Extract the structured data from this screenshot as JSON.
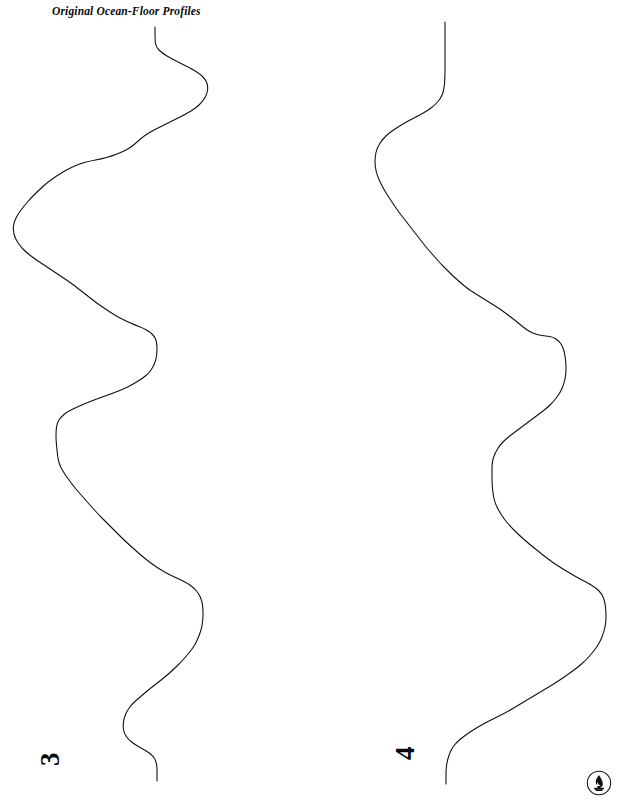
{
  "page": {
    "width": 623,
    "height": 804,
    "background_color": "#ffffff",
    "ink_color": "#111111"
  },
  "figure": {
    "title": "Original Ocean-Floor Profiles",
    "title_style": "bold-italic-serif"
  },
  "profiles": [
    {
      "label": "3",
      "label_orientation": "rotated-90-ccw",
      "name": "ocean-floor-profile-3",
      "description": "Left sounding trace, runs top to bottom with four major lobes",
      "stroke_color": "#111111",
      "stroke_width": 1.1,
      "points": [
        [
          155,
          27
        ],
        [
          155,
          40
        ],
        [
          156,
          47
        ],
        [
          162,
          53
        ],
        [
          172,
          59
        ],
        [
          182,
          64
        ],
        [
          192,
          69
        ],
        [
          200,
          74
        ],
        [
          206,
          80
        ],
        [
          208,
          87
        ],
        [
          207,
          94
        ],
        [
          203,
          101
        ],
        [
          196,
          108
        ],
        [
          186,
          114
        ],
        [
          174,
          120
        ],
        [
          162,
          126
        ],
        [
          152,
          131
        ],
        [
          144,
          136
        ],
        [
          137,
          142
        ],
        [
          130,
          148
        ],
        [
          122,
          152
        ],
        [
          112,
          156
        ],
        [
          101,
          159
        ],
        [
          90,
          161
        ],
        [
          79,
          164
        ],
        [
          68,
          169
        ],
        [
          58,
          175
        ],
        [
          48,
          182
        ],
        [
          39,
          190
        ],
        [
          31,
          198
        ],
        [
          24,
          206
        ],
        [
          18,
          214
        ],
        [
          14,
          222
        ],
        [
          13,
          230
        ],
        [
          15,
          238
        ],
        [
          20,
          246
        ],
        [
          27,
          253
        ],
        [
          35,
          259
        ],
        [
          44,
          265
        ],
        [
          53,
          271
        ],
        [
          62,
          277
        ],
        [
          71,
          283
        ],
        [
          80,
          290
        ],
        [
          89,
          297
        ],
        [
          98,
          304
        ],
        [
          107,
          310
        ],
        [
          116,
          316
        ],
        [
          126,
          321
        ],
        [
          135,
          325
        ],
        [
          143,
          328
        ],
        [
          150,
          332
        ],
        [
          155,
          337
        ],
        [
          157,
          344
        ],
        [
          157,
          352
        ],
        [
          156,
          360
        ],
        [
          153,
          367
        ],
        [
          149,
          373
        ],
        [
          143,
          378
        ],
        [
          135,
          383
        ],
        [
          126,
          388
        ],
        [
          116,
          392
        ],
        [
          105,
          396
        ],
        [
          94,
          400
        ],
        [
          84,
          404
        ],
        [
          75,
          408
        ],
        [
          67,
          412
        ],
        [
          61,
          417
        ],
        [
          57,
          423
        ],
        [
          56,
          431
        ],
        [
          56,
          440
        ],
        [
          57,
          450
        ],
        [
          58,
          459
        ],
        [
          60,
          466
        ],
        [
          64,
          473
        ],
        [
          69,
          480
        ],
        [
          75,
          488
        ],
        [
          82,
          496
        ],
        [
          90,
          505
        ],
        [
          98,
          514
        ],
        [
          107,
          523
        ],
        [
          116,
          532
        ],
        [
          125,
          541
        ],
        [
          134,
          549
        ],
        [
          143,
          557
        ],
        [
          152,
          564
        ],
        [
          161,
          570
        ],
        [
          170,
          575
        ],
        [
          179,
          579
        ],
        [
          187,
          583
        ],
        [
          194,
          588
        ],
        [
          199,
          594
        ],
        [
          202,
          601
        ],
        [
          203,
          609
        ],
        [
          203,
          618
        ],
        [
          202,
          627
        ],
        [
          199,
          636
        ],
        [
          195,
          645
        ],
        [
          189,
          653
        ],
        [
          182,
          661
        ],
        [
          174,
          669
        ],
        [
          165,
          677
        ],
        [
          156,
          684
        ],
        [
          147,
          691
        ],
        [
          139,
          698
        ],
        [
          132,
          704
        ],
        [
          127,
          711
        ],
        [
          124,
          718
        ],
        [
          123,
          726
        ],
        [
          124,
          733
        ],
        [
          128,
          739
        ],
        [
          134,
          744
        ],
        [
          141,
          748
        ],
        [
          148,
          752
        ],
        [
          153,
          756
        ],
        [
          156,
          761
        ],
        [
          157,
          767
        ],
        [
          157,
          774
        ],
        [
          157,
          781
        ]
      ]
    },
    {
      "label": "4",
      "label_orientation": "rotated-90-ccw",
      "name": "ocean-floor-profile-4",
      "description": "Right sounding trace, runs top to bottom with four major lobes",
      "stroke_color": "#111111",
      "stroke_width": 1.1,
      "points": [
        [
          445,
          22
        ],
        [
          445,
          40
        ],
        [
          445,
          60
        ],
        [
          445,
          78
        ],
        [
          444,
          90
        ],
        [
          441,
          98
        ],
        [
          435,
          105
        ],
        [
          427,
          111
        ],
        [
          418,
          116
        ],
        [
          408,
          121
        ],
        [
          398,
          127
        ],
        [
          389,
          133
        ],
        [
          382,
          140
        ],
        [
          377,
          148
        ],
        [
          375,
          157
        ],
        [
          375,
          166
        ],
        [
          377,
          175
        ],
        [
          381,
          184
        ],
        [
          386,
          193
        ],
        [
          392,
          202
        ],
        [
          398,
          211
        ],
        [
          405,
          220
        ],
        [
          412,
          229
        ],
        [
          419,
          238
        ],
        [
          426,
          247
        ],
        [
          433,
          255
        ],
        [
          440,
          263
        ],
        [
          447,
          270
        ],
        [
          454,
          277
        ],
        [
          461,
          283
        ],
        [
          468,
          289
        ],
        [
          476,
          294
        ],
        [
          484,
          299
        ],
        [
          492,
          304
        ],
        [
          500,
          309
        ],
        [
          508,
          315
        ],
        [
          516,
          321
        ],
        [
          523,
          327
        ],
        [
          530,
          332
        ],
        [
          538,
          335
        ],
        [
          546,
          336
        ],
        [
          553,
          337
        ],
        [
          559,
          341
        ],
        [
          563,
          347
        ],
        [
          565,
          355
        ],
        [
          566,
          364
        ],
        [
          566,
          374
        ],
        [
          564,
          384
        ],
        [
          560,
          393
        ],
        [
          554,
          401
        ],
        [
          547,
          408
        ],
        [
          539,
          414
        ],
        [
          531,
          420
        ],
        [
          523,
          426
        ],
        [
          515,
          432
        ],
        [
          507,
          438
        ],
        [
          500,
          445
        ],
        [
          495,
          453
        ],
        [
          492,
          462
        ],
        [
          492,
          472
        ],
        [
          492,
          483
        ],
        [
          493,
          494
        ],
        [
          495,
          503
        ],
        [
          499,
          511
        ],
        [
          504,
          519
        ],
        [
          511,
          527
        ],
        [
          519,
          535
        ],
        [
          528,
          543
        ],
        [
          538,
          551
        ],
        [
          548,
          559
        ],
        [
          558,
          566
        ],
        [
          568,
          572
        ],
        [
          578,
          578
        ],
        [
          588,
          583
        ],
        [
          596,
          588
        ],
        [
          602,
          594
        ],
        [
          605,
          602
        ],
        [
          606,
          612
        ],
        [
          606,
          622
        ],
        [
          604,
          632
        ],
        [
          600,
          642
        ],
        [
          594,
          651
        ],
        [
          586,
          660
        ],
        [
          577,
          668
        ],
        [
          567,
          675
        ],
        [
          557,
          682
        ],
        [
          547,
          688
        ],
        [
          537,
          694
        ],
        [
          527,
          700
        ],
        [
          517,
          706
        ],
        [
          507,
          712
        ],
        [
          497,
          717
        ],
        [
          487,
          722
        ],
        [
          478,
          727
        ],
        [
          470,
          732
        ],
        [
          463,
          737
        ],
        [
          457,
          742
        ],
        [
          452,
          748
        ],
        [
          449,
          755
        ],
        [
          447,
          762
        ],
        [
          446,
          770
        ],
        [
          446,
          778
        ],
        [
          446,
          784
        ]
      ]
    }
  ],
  "publisher_logo": {
    "name": "flame-torch-logo",
    "shape": "circle-with-flame",
    "color": "#111111"
  }
}
